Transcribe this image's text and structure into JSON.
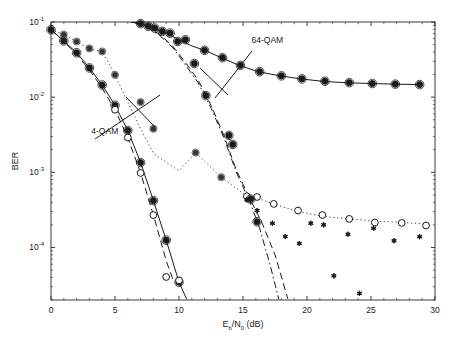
{
  "chart_data": {
    "type": "line",
    "title": "",
    "xlabel": "E_b/N_0 (dB)",
    "ylabel": "BER",
    "xlim": [
      0,
      30
    ],
    "ylim": [
      2e-05,
      0.1
    ],
    "yscale": "log",
    "grid": false,
    "legend_position": "none",
    "xticks": [
      0,
      5,
      10,
      15,
      20,
      25,
      30
    ],
    "xticklabels": [
      "0",
      "5",
      "10",
      "15",
      "20",
      "25",
      "30"
    ],
    "yticks": [
      0.1,
      0.01,
      0.001,
      0.0001
    ],
    "yticklabels": [
      "10^-1",
      "10^-2",
      "10^-3",
      "10^-4"
    ],
    "ytick_mantissa": [
      "10",
      "10",
      "10",
      "10"
    ],
    "ytick_exponent": [
      "-1",
      "-2",
      "-3",
      "-4"
    ],
    "annotations": [
      {
        "text": "4-QAM",
        "x": 4.2,
        "y": 0.0032,
        "pointer": true
      },
      {
        "text": "64-QAM",
        "x": 16.9,
        "y": 0.052,
        "pointer": true
      }
    ],
    "series": [
      {
        "name": "4-QAM solid theory",
        "style": "solid",
        "marker": "none",
        "color": "#1a1a1a",
        "x": [
          0,
          1,
          2,
          3,
          4,
          5,
          6,
          7,
          8,
          9,
          10,
          10.6
        ],
        "y": [
          0.079,
          0.056,
          0.039,
          0.0245,
          0.0145,
          0.0078,
          0.0036,
          0.00135,
          0.00042,
          0.000125,
          3.45e-05,
          2.05e-05
        ]
      },
      {
        "name": "4-QAM solid markers",
        "style": "none",
        "marker": "filled-circle",
        "color": "#1a1a1a",
        "x": [
          0,
          1,
          2,
          3,
          4,
          5,
          6,
          7,
          8,
          9,
          10
        ],
        "y": [
          0.079,
          0.056,
          0.039,
          0.0245,
          0.0145,
          0.0078,
          0.0036,
          0.00135,
          0.00042,
          0.000125,
          3.45e-05
        ]
      },
      {
        "name": "4-QAM dashed",
        "style": "dashed",
        "marker": "none",
        "color": "#1a1a1a",
        "x": [
          0,
          1,
          2,
          3,
          4,
          5,
          6,
          7,
          8,
          9,
          9.6
        ],
        "y": [
          0.079,
          0.055,
          0.037,
          0.023,
          0.0132,
          0.0068,
          0.0029,
          0.00098,
          0.00027,
          6.65e-05,
          3.45e-05
        ]
      },
      {
        "name": "4-QAM dashed markers",
        "style": "none",
        "marker": "open-circle",
        "color": "#1a1a1a",
        "x": [
          5,
          6,
          7,
          8,
          9,
          10
        ],
        "y": [
          0.0068,
          0.0029,
          0.00098,
          0.00027,
          4.05e-05,
          3.65e-05
        ]
      },
      {
        "name": "4-QAM fading dotted",
        "style": "dotted",
        "marker": "none",
        "color": "#4d4d4d",
        "x": [
          0,
          1,
          2,
          3,
          4,
          5,
          6,
          7,
          8,
          9,
          10,
          11.3,
          13.3,
          15.3,
          16,
          17.4,
          19.3,
          21.2,
          23.3,
          25.3,
          27.4,
          29.3
        ],
        "y": [
          0.079,
          0.068,
          0.055,
          0.044,
          0.0405,
          0.0198,
          0.0086,
          0.0038,
          0.0018,
          0.00135,
          0.00105,
          0.00183,
          0.00086,
          0.00048,
          0.00046,
          0.00038,
          0.0003,
          0.00026,
          0.00024,
          0.000225,
          0.000215,
          0.000205
        ]
      },
      {
        "name": "4-QAM fading markers",
        "style": "none",
        "marker": "filled-circle-small",
        "color": "#333333",
        "x": [
          1,
          2,
          3,
          4,
          5,
          7,
          8,
          11.3,
          13.3
        ],
        "y": [
          0.068,
          0.055,
          0.0445,
          0.0405,
          0.0198,
          0.0086,
          0.0038,
          0.00183,
          0.00086
        ]
      },
      {
        "name": "4-QAM fading open markers",
        "style": "none",
        "marker": "open-circle",
        "color": "#1a1a1a",
        "x": [
          15.3,
          16.1,
          17.4,
          19.3,
          21.2,
          23.3,
          25.3,
          27.4,
          29.3
        ],
        "y": [
          0.00048,
          0.00047,
          0.00038,
          0.00031,
          0.00027,
          0.00024,
          0.000215,
          0.000212,
          0.000196
        ]
      },
      {
        "name": "64-QAM solid fading",
        "style": "solid",
        "marker": "none",
        "color": "#1a1a1a",
        "x": [
          6.2,
          7,
          8,
          9,
          10,
          11,
          12,
          13.3,
          14.7,
          16.2,
          17.9,
          19.5,
          21.3,
          23.2,
          25,
          26.8,
          28.7
        ],
        "y": [
          0.1,
          0.095,
          0.082,
          0.071,
          0.058,
          0.048,
          0.042,
          0.0335,
          0.0265,
          0.0218,
          0.0192,
          0.0175,
          0.0162,
          0.0155,
          0.0152,
          0.0149,
          0.0147
        ]
      },
      {
        "name": "64-QAM solid markers",
        "style": "none",
        "marker": "filled-circle",
        "color": "#1a1a1a",
        "x": [
          7,
          8.1,
          9.3,
          10.5,
          12,
          13.4,
          14.8,
          16.3,
          18,
          19.6,
          21.4,
          23.3,
          25.1,
          26.9,
          28.8
        ],
        "y": [
          0.095,
          0.083,
          0.071,
          0.058,
          0.042,
          0.0335,
          0.0265,
          0.0218,
          0.0192,
          0.0175,
          0.0163,
          0.0156,
          0.0152,
          0.0149,
          0.0147
        ]
      },
      {
        "name": "64-QAM dashed AWGN",
        "style": "dashed",
        "marker": "none",
        "color": "#1a1a1a",
        "x": [
          6.6,
          7.5,
          8.5,
          9.5,
          10.5,
          11.5,
          12.5,
          13.5,
          14.5,
          15.5,
          16.5,
          17.5,
          18.5
        ],
        "y": [
          0.1,
          0.086,
          0.068,
          0.048,
          0.029,
          0.0168,
          0.0078,
          0.0031,
          0.00105,
          0.00046,
          0.00021,
          8e-05,
          2.08e-05
        ]
      },
      {
        "name": "64-QAM dashed markers",
        "style": "none",
        "marker": "filled-circle",
        "color": "#1a1a1a",
        "x": [
          7.6,
          8.7,
          9.9,
          11.2,
          12.1,
          13.9,
          14.2,
          15.6,
          16.1
        ],
        "y": [
          0.088,
          0.075,
          0.055,
          0.028,
          0.0105,
          0.0031,
          0.00235,
          0.00044,
          0.00022
        ]
      },
      {
        "name": "64-QAM dash-dot AWGN",
        "style": "dashdot",
        "marker": "none",
        "color": "#1a1a1a",
        "x": [
          6.4,
          7.5,
          8.5,
          9.5,
          10.5,
          11.5,
          12.5,
          13.5,
          14.5,
          15.5,
          16.3,
          17.1,
          17.8
        ],
        "y": [
          0.1,
          0.085,
          0.066,
          0.046,
          0.027,
          0.0155,
          0.0072,
          0.0029,
          0.00098,
          0.00042,
          0.00018,
          6e-05,
          2.05e-05
        ]
      },
      {
        "name": "64-QAM fading asterisks",
        "style": "none",
        "marker": "asterisk",
        "color": "#1a1a1a",
        "x": [
          15.3,
          16.1,
          17.3,
          18.3,
          19.4,
          20.3,
          21.3,
          22.1,
          23.2,
          24.1,
          25.2,
          26.8,
          28.8
        ],
        "y": [
          0.00043,
          0.00031,
          0.00021,
          0.00014,
          0.000113,
          0.00021,
          0.0002,
          4.2e-05,
          0.00015,
          2.45e-05,
          0.00018,
          0.000123,
          0.000139
        ]
      }
    ]
  },
  "axes": {
    "x_label_main": "E",
    "x_label_sub1": "b",
    "x_label_slash": "/N",
    "x_label_sub2": "0",
    "x_label_units": " (dB)",
    "y_label": "BER"
  }
}
